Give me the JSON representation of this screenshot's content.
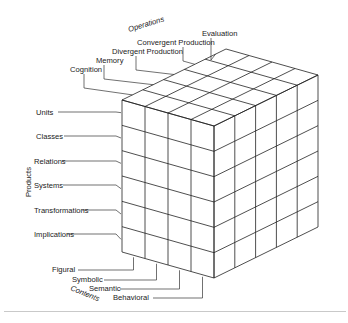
{
  "diagram": {
    "axes": {
      "operations": {
        "label": "Operations",
        "items": [
          "Cognition",
          "Memory",
          "Divergent Production",
          "Convergent Production",
          "Evaluation"
        ]
      },
      "products": {
        "label": "Products",
        "items": [
          "Units",
          "Classes",
          "Relations",
          "Systems",
          "Transformations",
          "Implications"
        ]
      },
      "contents": {
        "label": "Contents",
        "items": [
          "Figural",
          "Symbolic",
          "Semantic",
          "Behavioral"
        ]
      }
    },
    "colors": {
      "line": "#222222",
      "text": "#1a1a1a",
      "rule": "#c9c9c9",
      "background": "#ffffff"
    }
  }
}
